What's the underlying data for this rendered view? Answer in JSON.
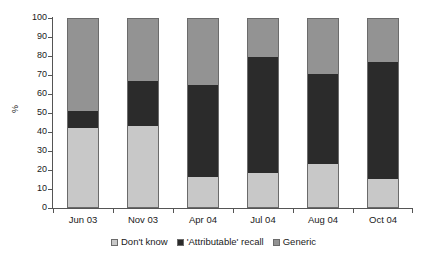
{
  "chart_data": {
    "type": "bar",
    "subtype": "stacked-bar",
    "title": "",
    "xlabel": "",
    "ylabel": "%",
    "ylim": [
      0,
      100
    ],
    "ytick_step": 10,
    "yticks": [
      0,
      10,
      20,
      30,
      40,
      50,
      60,
      70,
      80,
      90,
      100
    ],
    "ytick_labels": [
      "0",
      "10",
      "20",
      "30",
      "40",
      "50",
      "60",
      "70",
      "80",
      "90",
      "100"
    ],
    "grid": false,
    "legend_position": "bottom-center",
    "categories": [
      "Jun 03",
      "Nov 03",
      "Apr 04",
      "Jul 04",
      "Aug 04",
      "Oct 04"
    ],
    "series": [
      {
        "name": "Don't know",
        "color": "#c8c8c8",
        "values": [
          42,
          43,
          16,
          18,
          23,
          15
        ]
      },
      {
        "name": "'Attributable' recall",
        "color": "#2b2b2b",
        "values": [
          9,
          24,
          49,
          62,
          48,
          62
        ]
      },
      {
        "name": "Generic",
        "color": "#939393",
        "values": [
          49,
          33,
          35,
          20,
          29,
          23
        ]
      }
    ],
    "cumulative_tops": [
      {
        "category": "Jun 03",
        "dont_know_top": 42,
        "attributable_top": 51,
        "generic_top": 100
      },
      {
        "category": "Nov 03",
        "dont_know_top": 43,
        "attributable_top": 67,
        "generic_top": 100
      },
      {
        "category": "Apr 04",
        "dont_know_top": 16,
        "attributable_top": 65,
        "generic_top": 100
      },
      {
        "category": "Jul 04",
        "dont_know_top": 18,
        "attributable_top": 80,
        "generic_top": 100
      },
      {
        "category": "Aug 04",
        "dont_know_top": 23,
        "attributable_top": 71,
        "generic_top": 100
      },
      {
        "category": "Oct 04",
        "dont_know_top": 15,
        "attributable_top": 77,
        "generic_top": 100
      }
    ]
  },
  "axis": {
    "y_title": "%"
  },
  "legend": {
    "items": [
      {
        "label": "Don't know",
        "color": "#c8c8c8"
      },
      {
        "label": "'Attributable' recall",
        "color": "#2b2b2b"
      },
      {
        "label": "Generic",
        "color": "#939393"
      }
    ]
  }
}
